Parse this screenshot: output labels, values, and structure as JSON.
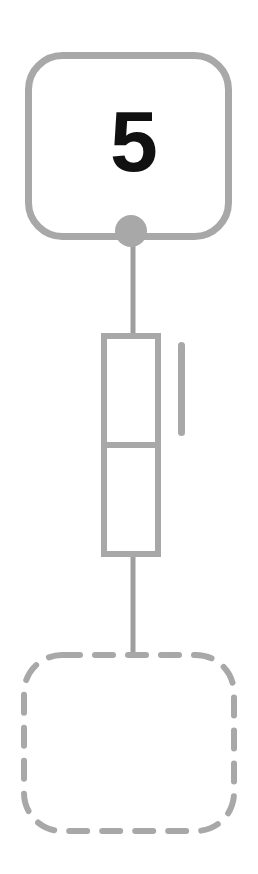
{
  "diagram": {
    "type": "flow-diagram",
    "background_color": "#ffffff",
    "stroke_color": "#a0a0a0",
    "line_color": "#9e9e9e",
    "text_color": "#111111",
    "nodes": [
      {
        "id": "top-card",
        "shape": "rounded-rectangle",
        "style": "solid",
        "label": "5",
        "label_color": "#111111",
        "stroke_color": "#a8a8a8",
        "stroke_width": 7,
        "corner_radius": 36,
        "x": 25,
        "y": 52,
        "width": 207,
        "height": 188
      },
      {
        "id": "connector-dot",
        "shape": "circle",
        "style": "filled",
        "fill_color": "#a8a8a8",
        "cx": 131,
        "cy": 231,
        "r": 16
      },
      {
        "id": "middle-table",
        "shape": "rectangle",
        "style": "solid",
        "stroke_color": "#a8a8a8",
        "stroke_width": 6,
        "x": 101,
        "y": 333,
        "width": 60,
        "height": 224,
        "divider_y": 445,
        "cells": 2
      },
      {
        "id": "side-bar",
        "shape": "rounded-bar",
        "style": "filled",
        "fill_color": "#a8a8a8",
        "x": 178,
        "y": 342,
        "width": 7,
        "height": 94,
        "corner_radius": 4
      },
      {
        "id": "bottom-placeholder",
        "shape": "rounded-rectangle",
        "style": "dashed",
        "label": "",
        "stroke_color": "#a8a8a8",
        "stroke_width": 6,
        "corner_radius": 38,
        "dash_length": 18,
        "dash_gap": 15,
        "x": 21,
        "y": 652,
        "width": 216,
        "height": 182
      }
    ],
    "edges": [
      {
        "id": "edge-card-to-table",
        "from": "connector-dot",
        "to": "middle-table",
        "x": 133,
        "y1": 231,
        "y2": 333,
        "width": 5,
        "color": "#9e9e9e"
      },
      {
        "id": "edge-table-to-placeholder",
        "from": "middle-table",
        "to": "bottom-placeholder",
        "x": 133,
        "y1": 557,
        "y2": 655,
        "width": 5,
        "color": "#9e9e9e"
      }
    ]
  }
}
